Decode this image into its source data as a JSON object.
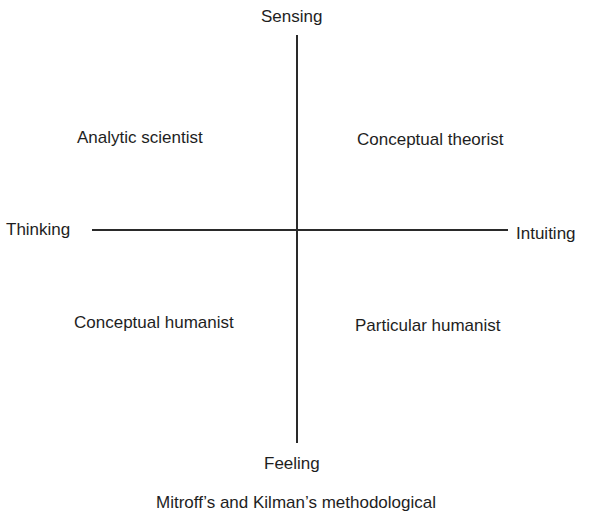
{
  "diagram": {
    "axes": {
      "top": "Sensing",
      "bottom": "Feeling",
      "left": "Thinking",
      "right": "Intuiting"
    },
    "quadrants": {
      "top_left": "Analytic scientist",
      "top_right": "Conceptual theorist",
      "bottom_left": "Conceptual humanist",
      "bottom_right": "Particular humanist"
    },
    "caption": "Mitroff’s and Kilman’s methodological"
  }
}
